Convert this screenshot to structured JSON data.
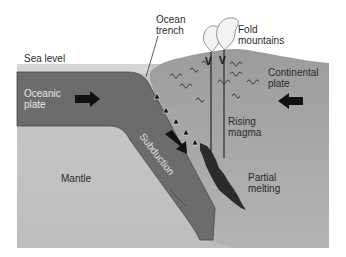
{
  "diagram": {
    "labels": {
      "ocean_trench": "Ocean\ntrench",
      "ocean_trench_line1": "Ocean",
      "ocean_trench_line2": "trench",
      "fold_mountains_line1": "Fold",
      "fold_mountains_line2": "mountains",
      "sea_level": "Sea level",
      "oceanic_plate_line1": "Oceanic",
      "oceanic_plate_line2": "plate",
      "continental_plate_line1": "Continental",
      "continental_plate_line2": "plate",
      "rising_magma_line1": "Rising",
      "rising_magma_line2": "magma",
      "subduction": "Subduction",
      "mantle": "Mantle",
      "partial_melting_line1": "Partial",
      "partial_melting_line2": "melting"
    },
    "volcano_marks": [
      "V",
      "V"
    ],
    "colors": {
      "sea_level_band": "#d4d4d4",
      "oceanic_plate": "#6e6e6e",
      "continental_plate": "#9a9a9a",
      "mantle": "#c8c8c8",
      "magma": "#2b2b2b",
      "arrow": "#111111",
      "smoke": "#f2f2f2"
    }
  }
}
